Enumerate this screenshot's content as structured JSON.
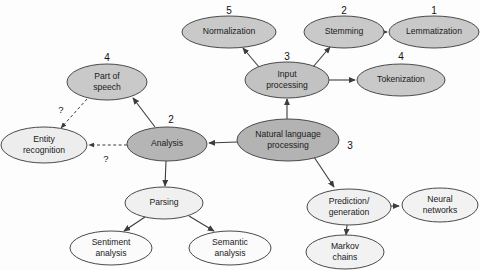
{
  "diagram": {
    "background_color": "#fdfdfd",
    "node_stroke_color": "#4a4a4a",
    "edge_color": "#3c3c3c",
    "fills": {
      "dark": "#b3b3b3",
      "medium": "#c9c9c9",
      "light": "#e3e3e3",
      "pale": "#f2f2f2",
      "white": "#fbfbfb"
    },
    "nodes": [
      {
        "id": "normalization",
        "label_line1": "Normalization",
        "label_line2": "",
        "cx": 229,
        "cy": 32,
        "rx": 47,
        "ry": 16,
        "fill": "#c9c9c9",
        "rank": "5",
        "rank_x": 229,
        "rank_y": 11
      },
      {
        "id": "stemming",
        "label_line1": "Stemming",
        "label_line2": "",
        "cx": 344,
        "cy": 32,
        "rx": 40,
        "ry": 16,
        "fill": "#c9c9c9",
        "rank": "2",
        "rank_x": 344,
        "rank_y": 11
      },
      {
        "id": "lemmatization",
        "label_line1": "Lemmatization",
        "label_line2": "",
        "cx": 434,
        "cy": 32,
        "rx": 45,
        "ry": 16,
        "fill": "#c9c9c9",
        "rank": "1",
        "rank_x": 434,
        "rank_y": 11
      },
      {
        "id": "input-processing",
        "label_line1": "Input",
        "label_line2": "processing",
        "cx": 287,
        "cy": 80,
        "rx": 42,
        "ry": 18,
        "fill": "#c2c2c2",
        "rank": "3",
        "rank_x": 287,
        "rank_y": 57
      },
      {
        "id": "tokenization",
        "label_line1": "Tokenization",
        "label_line2": "",
        "cx": 401,
        "cy": 80,
        "rx": 44,
        "ry": 16,
        "fill": "#c9c9c9",
        "rank": "4",
        "rank_x": 401,
        "rank_y": 57
      },
      {
        "id": "part-of-speech",
        "label_line1": "Part of",
        "label_line2": "speech",
        "cx": 107,
        "cy": 82,
        "rx": 40,
        "ry": 18,
        "fill": "#c9c9c9",
        "rank": "4",
        "rank_x": 107,
        "rank_y": 58
      },
      {
        "id": "natural-language-processing",
        "label_line1": "Natural language",
        "label_line2": "processing",
        "cx": 288,
        "cy": 140,
        "rx": 51,
        "ry": 21,
        "fill": "#b3b3b3",
        "rank": "3",
        "rank_x": 350,
        "rank_y": 146
      },
      {
        "id": "analysis",
        "label_line1": "Analysis",
        "label_line2": "",
        "cx": 167,
        "cy": 144,
        "rx": 40,
        "ry": 17,
        "fill": "#b5b5b5",
        "rank": "2",
        "rank_x": 171,
        "rank_y": 120
      },
      {
        "id": "entity-recognition",
        "label_line1": "Entity",
        "label_line2": "recognition",
        "cx": 44,
        "cy": 145,
        "rx": 43,
        "ry": 18,
        "fill": "#ededed",
        "rank": "",
        "rank_x": 0,
        "rank_y": 0
      },
      {
        "id": "parsing",
        "label_line1": "Parsing",
        "label_line2": "",
        "cx": 164,
        "cy": 203,
        "rx": 39,
        "ry": 16,
        "fill": "#f0f0f0",
        "rank": "",
        "rank_x": 0,
        "rank_y": 0
      },
      {
        "id": "sentiment-analysis",
        "label_line1": "Sentiment",
        "label_line2": "analysis",
        "cx": 111,
        "cy": 248,
        "rx": 41,
        "ry": 17,
        "fill": "#fbfbfb",
        "rank": "",
        "rank_x": 0,
        "rank_y": 0
      },
      {
        "id": "semantic-analysis",
        "label_line1": "Semantic",
        "label_line2": "analysis",
        "cx": 230,
        "cy": 248,
        "rx": 41,
        "ry": 17,
        "fill": "#fbfbfb",
        "rank": "",
        "rank_x": 0,
        "rank_y": 0
      },
      {
        "id": "prediction-generation",
        "label_line1": "Prediction/",
        "label_line2": "generation",
        "cx": 349,
        "cy": 207,
        "rx": 42,
        "ry": 18,
        "fill": "#f0f0f0",
        "rank": "",
        "rank_x": 0,
        "rank_y": 0
      },
      {
        "id": "neural-networks",
        "label_line1": "Neural",
        "label_line2": "networks",
        "cx": 440,
        "cy": 205,
        "rx": 38,
        "ry": 17,
        "fill": "#f2f2f2",
        "rank": "",
        "rank_x": 0,
        "rank_y": 0
      },
      {
        "id": "markov-chains",
        "label_line1": "Markov",
        "label_line2": "chains",
        "cx": 345,
        "cy": 252,
        "rx": 39,
        "ry": 17,
        "fill": "#f2f2f2",
        "rank": "",
        "rank_x": 0,
        "rank_y": 0
      }
    ],
    "edges": [
      {
        "id": "nlp-to-analysis",
        "from": "natural-language-processing",
        "to": "analysis",
        "x1": 237,
        "y1": 142,
        "x2": 209,
        "y2": 143,
        "style": "solid"
      },
      {
        "id": "nlp-to-input-processing",
        "from": "natural-language-processing",
        "to": "input-processing",
        "x1": 287,
        "y1": 119,
        "x2": 287,
        "y2": 99,
        "style": "solid"
      },
      {
        "id": "nlp-to-prediction-generation",
        "from": "natural-language-processing",
        "to": "prediction-generation",
        "x1": 314,
        "y1": 157,
        "x2": 334,
        "y2": 187,
        "style": "solid"
      },
      {
        "id": "input-processing-to-normalization",
        "from": "input-processing",
        "to": "normalization",
        "x1": 259,
        "y1": 67,
        "x2": 243,
        "y2": 48,
        "style": "solid"
      },
      {
        "id": "input-processing-to-stemming",
        "from": "input-processing",
        "to": "stemming",
        "x1": 313,
        "y1": 67,
        "x2": 330,
        "y2": 47,
        "style": "solid"
      },
      {
        "id": "input-processing-to-tokenization",
        "from": "input-processing",
        "to": "tokenization",
        "x1": 329,
        "y1": 80,
        "x2": 355,
        "y2": 80,
        "style": "solid"
      },
      {
        "id": "stemming-to-lemmatization",
        "from": "stemming",
        "to": "lemmatization",
        "x1": 384,
        "y1": 32,
        "x2": 387,
        "y2": 32,
        "style": "solid"
      },
      {
        "id": "analysis-to-part-of-speech",
        "from": "analysis",
        "to": "part-of-speech",
        "x1": 155,
        "y1": 127,
        "x2": 133,
        "y2": 98,
        "style": "solid"
      },
      {
        "id": "analysis-to-parsing",
        "from": "analysis",
        "to": "parsing",
        "x1": 166,
        "y1": 161,
        "x2": 165,
        "y2": 186,
        "style": "solid"
      },
      {
        "id": "analysis-to-entity-recognition",
        "from": "analysis",
        "to": "entity-recognition",
        "x1": 127,
        "y1": 145,
        "x2": 89,
        "y2": 145,
        "style": "dashed",
        "label": "?",
        "label_x": 106,
        "label_y": 159
      },
      {
        "id": "part-of-speech-to-entity-recognition",
        "from": "part-of-speech",
        "to": "entity-recognition",
        "x1": 87,
        "y1": 99,
        "x2": 61,
        "y2": 128,
        "style": "dashed",
        "label": "?",
        "label_x": 61,
        "label_y": 110
      },
      {
        "id": "parsing-to-sentiment-analysis",
        "from": "parsing",
        "to": "sentiment-analysis",
        "x1": 145,
        "y1": 217,
        "x2": 124,
        "y2": 231,
        "style": "solid"
      },
      {
        "id": "parsing-to-semantic-analysis",
        "from": "parsing",
        "to": "semantic-analysis",
        "x1": 189,
        "y1": 216,
        "x2": 214,
        "y2": 231,
        "style": "solid"
      },
      {
        "id": "prediction-to-neural-networks",
        "from": "prediction-generation",
        "to": "neural-networks",
        "x1": 391,
        "y1": 206,
        "x2": 399,
        "y2": 206,
        "style": "solid"
      },
      {
        "id": "prediction-to-markov-chains",
        "from": "prediction-generation",
        "to": "markov-chains",
        "x1": 347,
        "y1": 225,
        "x2": 346,
        "y2": 235,
        "style": "solid"
      }
    ]
  }
}
